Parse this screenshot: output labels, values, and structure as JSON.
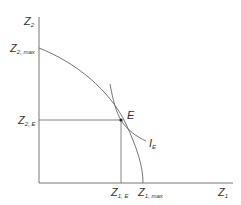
{
  "diagram": {
    "type": "production-possibility-frontier",
    "axes": {
      "y_label": {
        "base": "Z",
        "sub": "2"
      },
      "x_label": {
        "base": "Z",
        "sub": "1"
      }
    },
    "labels": {
      "z2_max": {
        "base": "Z",
        "sub": "2, max"
      },
      "z2_e": {
        "base": "Z",
        "sub": "2, E"
      },
      "z1_e": {
        "base": "Z",
        "sub": "1, E"
      },
      "z1_max": {
        "base": "Z",
        "sub": "1, max"
      },
      "point_e": "E",
      "indifference": {
        "base": "I",
        "sub": "E"
      }
    },
    "colors": {
      "line": "#555555",
      "text": "#333333",
      "point": "#222222"
    }
  }
}
